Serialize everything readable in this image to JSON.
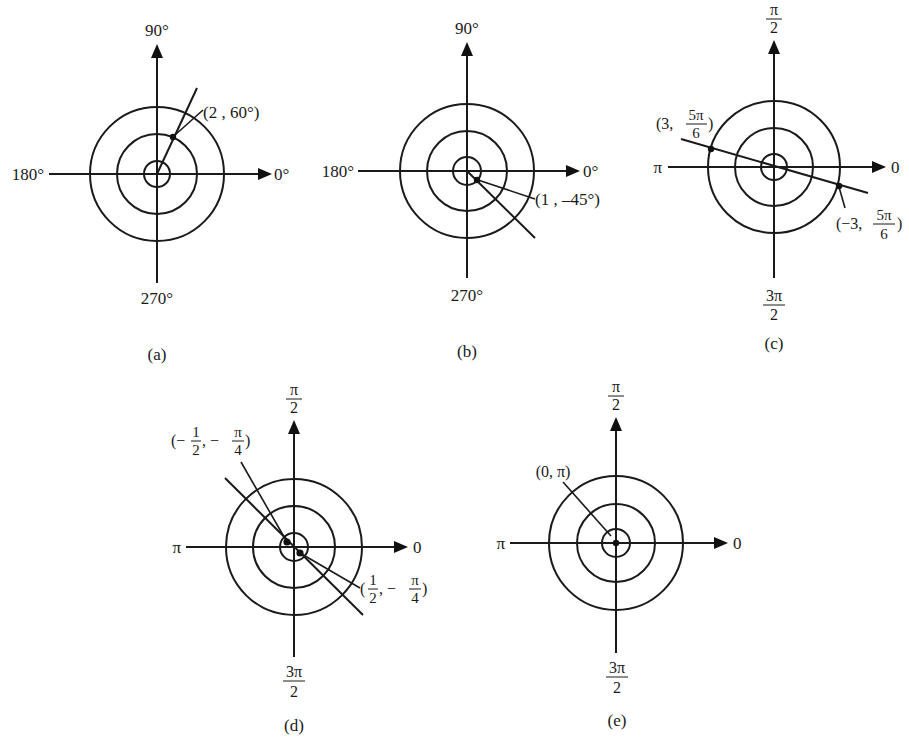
{
  "figure": {
    "panels": [
      {
        "id": "a",
        "caption": "(a)",
        "center": [
          157,
          174
        ],
        "radii": [
          13,
          40,
          67
        ],
        "axis_labels": {
          "top": "90°",
          "left": "180°",
          "right": "0°",
          "bottom": "270°"
        },
        "axis_label_style": "degrees",
        "points": [
          {
            "label": "(2 , 60°)",
            "r": 2,
            "theta": "60°",
            "position": [
              173,
              137
            ]
          }
        ]
      },
      {
        "id": "b",
        "caption": "(b)",
        "center": [
          467,
          171
        ],
        "radii": [
          14,
          40,
          67
        ],
        "axis_labels": {
          "top": "90°",
          "left": "180°",
          "right": "0°",
          "bottom": "270°"
        },
        "axis_label_style": "degrees",
        "points": [
          {
            "label": "(1 , –45°)",
            "r": 1,
            "theta": "-45°",
            "position": [
              477,
              180
            ]
          }
        ]
      },
      {
        "id": "c",
        "caption": "(c)",
        "center": [
          774,
          167
        ],
        "radii": [
          13,
          39,
          66
        ],
        "axis_labels": {
          "top_num": "π",
          "top_den": "2",
          "left": "π",
          "right": "0",
          "bottom_num": "3π",
          "bottom_den": "2"
        },
        "axis_label_style": "radians",
        "points": [
          {
            "label_prefix": "(3,",
            "label_num": "5π",
            "label_den": "6",
            "label_suffix": ")",
            "r": 3,
            "theta": "5π/6",
            "position": [
              711,
              149
            ]
          },
          {
            "label_prefix": "(−3,",
            "label_num": "5π",
            "label_den": "6",
            "label_suffix": ")",
            "r": -3,
            "theta": "5π/6",
            "position": [
              839,
              186
            ]
          }
        ]
      },
      {
        "id": "d",
        "caption": "(d)",
        "center": [
          294,
          547
        ],
        "radii": [
          14,
          41,
          68
        ],
        "axis_labels": {
          "top_num": "π",
          "top_den": "2",
          "left": "π",
          "right": "0",
          "bottom_num": "3π",
          "bottom_den": "2"
        },
        "axis_label_style": "radians",
        "points": [
          {
            "label_open": "(−",
            "label_num1": "1",
            "label_den1": "2",
            "label_sep": ", −",
            "label_num2": "π",
            "label_den2": "4",
            "label_close": ")",
            "r": -0.5,
            "theta": "-π/4",
            "position": [
              287,
              542
            ]
          },
          {
            "label_open": "(",
            "label_num1": "1",
            "label_den1": "2",
            "label_sep": ", −",
            "label_num2": "π",
            "label_den2": "4",
            "label_close": ")",
            "r": 0.5,
            "theta": "-π/4",
            "position": [
              300,
              553
            ]
          }
        ]
      },
      {
        "id": "e",
        "caption": "(e)",
        "center": [
          616,
          543
        ],
        "radii": [
          14,
          39,
          67
        ],
        "axis_labels": {
          "top_num": "π",
          "top_den": "2",
          "left": "π",
          "right": "0",
          "bottom_num": "3π",
          "bottom_den": "2"
        },
        "axis_label_style": "radians",
        "points": [
          {
            "label": "(0, π)",
            "r": 0,
            "theta": "π",
            "position": [
              616,
              543
            ]
          }
        ]
      }
    ]
  }
}
